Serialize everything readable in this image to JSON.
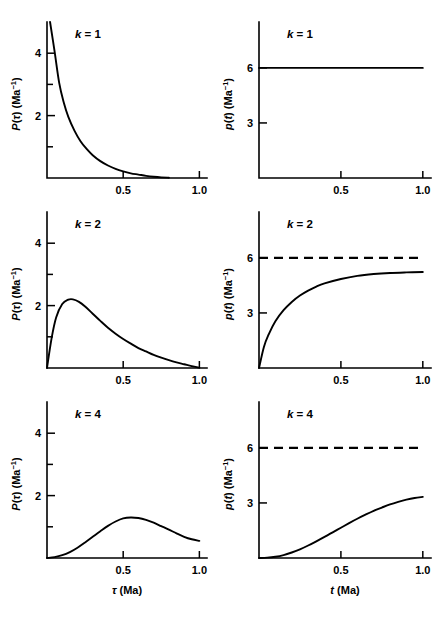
{
  "figure": {
    "background": "#ffffff",
    "ink": "#000000",
    "rows": 3,
    "cols": 2
  },
  "labels": {
    "xlabel_left": "τ (Ma)",
    "xlabel_right": "t (Ma)",
    "ylabel_left_base": "P(τ) (Ma",
    "ylabel_left_sup": "−1",
    "ylabel_left_tail": ")",
    "ylabel_right_base": "p(t) (Ma",
    "ylabel_right_sup": "−1",
    "ylabel_right_tail": ")",
    "k1": "k = 1",
    "k2": "k = 2",
    "k4": "k = 4",
    "xticks": [
      "0.5",
      "1.0"
    ],
    "yticks_left": [
      "2",
      "4"
    ],
    "yticks_right": [
      "3",
      "6"
    ]
  },
  "chart_data": [
    {
      "id": "panel-k1-left",
      "type": "line",
      "title": "k = 1",
      "xlabel": "τ (Ma)",
      "ylabel": "P(τ) (Ma−1)",
      "xlim": [
        0,
        1.05
      ],
      "ylim": [
        0,
        5.0
      ],
      "xticks": [
        0.5,
        1.0
      ],
      "xticklabels": [
        "0.5",
        "1.0"
      ],
      "yticks": [
        1,
        2,
        3,
        4
      ],
      "yticklabels": [
        "",
        "2",
        "",
        "4"
      ],
      "grid": false,
      "legend": "none",
      "series": [
        {
          "name": "P(tau), k=1",
          "x": [
            0.02,
            0.05,
            0.08,
            0.11,
            0.14,
            0.18,
            0.22,
            0.26,
            0.3,
            0.35,
            0.4,
            0.45,
            0.5,
            0.55,
            0.6,
            0.65,
            0.7,
            0.75,
            0.8
          ],
          "y": [
            5.0,
            4.05,
            3.05,
            2.42,
            1.96,
            1.52,
            1.18,
            0.93,
            0.73,
            0.54,
            0.4,
            0.29,
            0.21,
            0.15,
            0.11,
            0.07,
            0.04,
            0.02,
            0.01
          ]
        }
      ]
    },
    {
      "id": "panel-k1-right",
      "type": "line",
      "title": "k = 1",
      "xlabel": "t (Ma)",
      "ylabel": "p(t) (Ma−1)",
      "xlim": [
        0,
        1.05
      ],
      "ylim": [
        0,
        8.5
      ],
      "xticks": [
        0.5,
        1.0
      ],
      "xticklabels": [
        "0.5",
        "1.0"
      ],
      "yticks": [
        3,
        6
      ],
      "yticklabels": [
        "3",
        "6"
      ],
      "grid": false,
      "legend": "none",
      "series": [
        {
          "name": "p(t), k=1",
          "style": "solid",
          "x": [
            0.0,
            1.0
          ],
          "y": [
            6.0,
            6.0
          ]
        }
      ]
    },
    {
      "id": "panel-k2-left",
      "type": "line",
      "title": "k = 2",
      "xlabel": "τ (Ma)",
      "ylabel": "P(τ) (Ma−1)",
      "xlim": [
        0,
        1.05
      ],
      "ylim": [
        0,
        5.0
      ],
      "xticks": [
        0.5,
        1.0
      ],
      "xticklabels": [
        "0.5",
        "1.0"
      ],
      "yticks": [
        1,
        2,
        3,
        4
      ],
      "yticklabels": [
        "",
        "2",
        "",
        "4"
      ],
      "grid": false,
      "legend": "none",
      "peak": {
        "x": 0.17,
        "y": 2.2
      },
      "series": [
        {
          "name": "P(tau), k=2",
          "x": [
            0.0,
            0.03,
            0.06,
            0.1,
            0.14,
            0.17,
            0.21,
            0.25,
            0.3,
            0.35,
            0.4,
            0.45,
            0.5,
            0.55,
            0.6,
            0.65,
            0.7,
            0.75,
            0.8,
            0.85,
            0.9,
            0.95,
            1.0
          ],
          "y": [
            0.0,
            0.95,
            1.62,
            2.05,
            2.19,
            2.2,
            2.12,
            1.97,
            1.74,
            1.51,
            1.29,
            1.1,
            0.93,
            0.78,
            0.64,
            0.53,
            0.42,
            0.33,
            0.25,
            0.18,
            0.12,
            0.06,
            0.01
          ]
        }
      ]
    },
    {
      "id": "panel-k2-right",
      "type": "line",
      "title": "k = 2",
      "xlabel": "t (Ma)",
      "ylabel": "p(t) (Ma−1)",
      "xlim": [
        0,
        1.05
      ],
      "ylim": [
        0,
        8.5
      ],
      "xticks": [
        0.5,
        1.0
      ],
      "xticklabels": [
        "0.5",
        "1.0"
      ],
      "yticks": [
        3,
        6
      ],
      "yticklabels": [
        "3",
        "6"
      ],
      "grid": false,
      "legend": "none",
      "asymptote": {
        "y": 6.0,
        "style": "dashed"
      },
      "series": [
        {
          "name": "p(t), k=2",
          "style": "solid",
          "x": [
            0.0,
            0.03,
            0.06,
            0.1,
            0.15,
            0.2,
            0.25,
            0.3,
            0.35,
            0.4,
            0.5,
            0.6,
            0.7,
            0.8,
            0.9,
            1.0
          ],
          "y": [
            0.0,
            1.15,
            1.85,
            2.55,
            3.15,
            3.6,
            3.95,
            4.22,
            4.44,
            4.61,
            4.85,
            5.02,
            5.12,
            5.18,
            5.21,
            5.23
          ]
        },
        {
          "name": "asymptote p=6",
          "style": "dashed",
          "x": [
            0.0,
            1.0
          ],
          "y": [
            6.0,
            6.0
          ]
        }
      ]
    },
    {
      "id": "panel-k4-left",
      "type": "line",
      "title": "k = 4",
      "xlabel": "τ (Ma)",
      "ylabel": "P(τ) (Ma−1)",
      "xlim": [
        0,
        1.05
      ],
      "ylim": [
        0,
        5.0
      ],
      "xticks": [
        0.5,
        1.0
      ],
      "xticklabels": [
        "0.5",
        "1.0"
      ],
      "yticks": [
        1,
        2,
        3,
        4
      ],
      "yticklabels": [
        "",
        "2",
        "",
        "4"
      ],
      "grid": false,
      "legend": "none",
      "peak": {
        "x": 0.52,
        "y": 1.3
      },
      "series": [
        {
          "name": "P(tau), k=4",
          "x": [
            0.0,
            0.05,
            0.1,
            0.15,
            0.2,
            0.25,
            0.3,
            0.35,
            0.4,
            0.45,
            0.5,
            0.55,
            0.6,
            0.65,
            0.7,
            0.75,
            0.8,
            0.85,
            0.9,
            0.95,
            1.0
          ],
          "y": [
            0.0,
            0.03,
            0.09,
            0.19,
            0.33,
            0.5,
            0.68,
            0.86,
            1.03,
            1.17,
            1.27,
            1.3,
            1.28,
            1.22,
            1.13,
            1.02,
            0.91,
            0.79,
            0.68,
            0.6,
            0.55
          ]
        }
      ]
    },
    {
      "id": "panel-k4-right",
      "type": "line",
      "title": "k = 4",
      "xlabel": "t (Ma)",
      "ylabel": "p(t) (Ma−1)",
      "xlim": [
        0,
        1.05
      ],
      "ylim": [
        0,
        8.5
      ],
      "xticks": [
        0.5,
        1.0
      ],
      "xticklabels": [
        "0.5",
        "1.0"
      ],
      "yticks": [
        3,
        6
      ],
      "yticklabels": [
        "3",
        "6"
      ],
      "grid": false,
      "legend": "none",
      "asymptote": {
        "y": 6.0,
        "style": "dashed"
      },
      "series": [
        {
          "name": "p(t), k=4",
          "style": "solid",
          "x": [
            0.0,
            0.05,
            0.1,
            0.15,
            0.2,
            0.25,
            0.3,
            0.35,
            0.4,
            0.45,
            0.5,
            0.55,
            0.6,
            0.65,
            0.7,
            0.75,
            0.8,
            0.85,
            0.9,
            0.95,
            1.0
          ],
          "y": [
            0.0,
            0.02,
            0.07,
            0.16,
            0.3,
            0.47,
            0.68,
            0.91,
            1.15,
            1.4,
            1.65,
            1.9,
            2.14,
            2.36,
            2.57,
            2.75,
            2.92,
            3.06,
            3.18,
            3.27,
            3.33
          ]
        },
        {
          "name": "asymptote p=6",
          "style": "dashed",
          "x": [
            0.0,
            1.0
          ],
          "y": [
            6.0,
            6.0
          ]
        }
      ]
    }
  ]
}
